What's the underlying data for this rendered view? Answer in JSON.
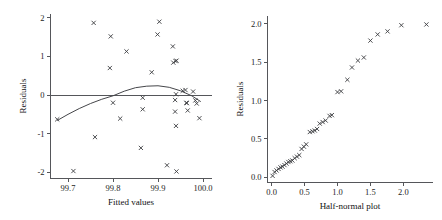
{
  "figure": {
    "background": "#ffffff",
    "marker_color": "#3b3c40",
    "axis_color": "#55565a",
    "marker_symbol": "x"
  },
  "chart_data": [
    {
      "type": "scatter",
      "title": "",
      "panel": "left",
      "xlabel": "Fitted values",
      "ylabel": "Residuals",
      "xlim": [
        99.66,
        100.02
      ],
      "ylim": [
        -2.15,
        2.1
      ],
      "xticks": [
        99.7,
        99.8,
        99.9,
        100.0
      ],
      "xticklabels": [
        "99.7",
        "99.8",
        "99.9",
        "100.0"
      ],
      "yticks": [
        -2,
        -1,
        0,
        1,
        2
      ],
      "yticklabels": [
        "-2",
        "-1",
        "0",
        "1",
        "2"
      ],
      "grid": false,
      "legend": "none",
      "reference_line": {
        "type": "horizontal",
        "y": 0
      },
      "fitted_curve": {
        "type": "lowess",
        "x": [
          99.676,
          99.7,
          99.725,
          99.75,
          99.775,
          99.8,
          99.825,
          99.85,
          99.875,
          99.9,
          99.925,
          99.95,
          99.975,
          99.995
        ],
        "y": [
          -0.66,
          -0.5,
          -0.35,
          -0.22,
          -0.11,
          -0.02,
          0.1,
          0.19,
          0.23,
          0.24,
          0.2,
          0.11,
          -0.02,
          -0.17
        ]
      },
      "points": [
        {
          "x": 99.676,
          "y": -0.63
        },
        {
          "x": 99.712,
          "y": -1.97
        },
        {
          "x": 99.757,
          "y": 1.87
        },
        {
          "x": 99.76,
          "y": -1.09
        },
        {
          "x": 99.795,
          "y": 1.52
        },
        {
          "x": 99.793,
          "y": 0.7
        },
        {
          "x": 99.8,
          "y": -0.2
        },
        {
          "x": 99.816,
          "y": -0.61
        },
        {
          "x": 99.83,
          "y": 1.13
        },
        {
          "x": 99.862,
          "y": -1.37
        },
        {
          "x": 99.866,
          "y": -0.07
        },
        {
          "x": 99.866,
          "y": -0.37
        },
        {
          "x": 99.886,
          "y": 0.59
        },
        {
          "x": 99.899,
          "y": 1.57
        },
        {
          "x": 99.903,
          "y": 1.9
        },
        {
          "x": 99.92,
          "y": -1.82
        },
        {
          "x": 99.933,
          "y": 1.26
        },
        {
          "x": 99.934,
          "y": 0.84
        },
        {
          "x": 99.939,
          "y": 0.88
        },
        {
          "x": 99.941,
          "y": 0.89
        },
        {
          "x": 99.938,
          "y": -0.13
        },
        {
          "x": 99.938,
          "y": -0.43
        },
        {
          "x": 99.94,
          "y": -0.8
        },
        {
          "x": 99.941,
          "y": -1.98
        },
        {
          "x": 99.94,
          "y": 0.02
        },
        {
          "x": 99.955,
          "y": 0.11
        },
        {
          "x": 99.961,
          "y": 0.13
        },
        {
          "x": 99.963,
          "y": -0.2
        },
        {
          "x": 99.964,
          "y": -0.21
        },
        {
          "x": 99.966,
          "y": -0.4
        },
        {
          "x": 99.978,
          "y": 0.09
        },
        {
          "x": 99.983,
          "y": -0.14
        },
        {
          "x": 99.986,
          "y": -0.22
        },
        {
          "x": 99.992,
          "y": -0.6
        }
      ]
    },
    {
      "type": "scatter",
      "title": "",
      "panel": "right",
      "xlabel": "Half-normal plot",
      "ylabel": "Residuals",
      "xlim": [
        -0.07,
        2.45
      ],
      "ylim": [
        -0.06,
        2.1
      ],
      "xticks": [
        0.0,
        0.5,
        1.0,
        1.5,
        2.0
      ],
      "xticklabels": [
        "0.0",
        "0.5",
        "1.0",
        "1.5",
        "2.0"
      ],
      "yticks": [
        0.0,
        0.5,
        1.0,
        1.5,
        2.0
      ],
      "yticklabels": [
        "0.0",
        "0.5",
        "1.0",
        "1.5",
        "2.0"
      ],
      "grid": false,
      "legend": "none",
      "points": [
        {
          "x": 0.015,
          "y": 0.02
        },
        {
          "x": 0.045,
          "y": 0.07
        },
        {
          "x": 0.075,
          "y": 0.09
        },
        {
          "x": 0.105,
          "y": 0.11
        },
        {
          "x": 0.135,
          "y": 0.13
        },
        {
          "x": 0.165,
          "y": 0.14
        },
        {
          "x": 0.195,
          "y": 0.16
        },
        {
          "x": 0.225,
          "y": 0.18
        },
        {
          "x": 0.255,
          "y": 0.2
        },
        {
          "x": 0.285,
          "y": 0.21
        },
        {
          "x": 0.315,
          "y": 0.22
        },
        {
          "x": 0.35,
          "y": 0.25
        },
        {
          "x": 0.385,
          "y": 0.27
        },
        {
          "x": 0.42,
          "y": 0.29
        },
        {
          "x": 0.455,
          "y": 0.37
        },
        {
          "x": 0.49,
          "y": 0.4
        },
        {
          "x": 0.525,
          "y": 0.43
        },
        {
          "x": 0.58,
          "y": 0.59
        },
        {
          "x": 0.62,
          "y": 0.6
        },
        {
          "x": 0.655,
          "y": 0.61
        },
        {
          "x": 0.69,
          "y": 0.63
        },
        {
          "x": 0.73,
          "y": 0.7
        },
        {
          "x": 0.775,
          "y": 0.72
        },
        {
          "x": 0.82,
          "y": 0.74
        },
        {
          "x": 0.88,
          "y": 0.8
        },
        {
          "x": 0.915,
          "y": 0.81
        },
        {
          "x": 1.0,
          "y": 1.11
        },
        {
          "x": 1.055,
          "y": 1.12
        },
        {
          "x": 1.15,
          "y": 1.27
        },
        {
          "x": 1.22,
          "y": 1.43
        },
        {
          "x": 1.31,
          "y": 1.52
        },
        {
          "x": 1.4,
          "y": 1.56
        },
        {
          "x": 1.5,
          "y": 1.78
        },
        {
          "x": 1.61,
          "y": 1.86
        },
        {
          "x": 1.76,
          "y": 1.9
        },
        {
          "x": 1.97,
          "y": 1.98
        },
        {
          "x": 2.35,
          "y": 1.99
        }
      ]
    }
  ]
}
